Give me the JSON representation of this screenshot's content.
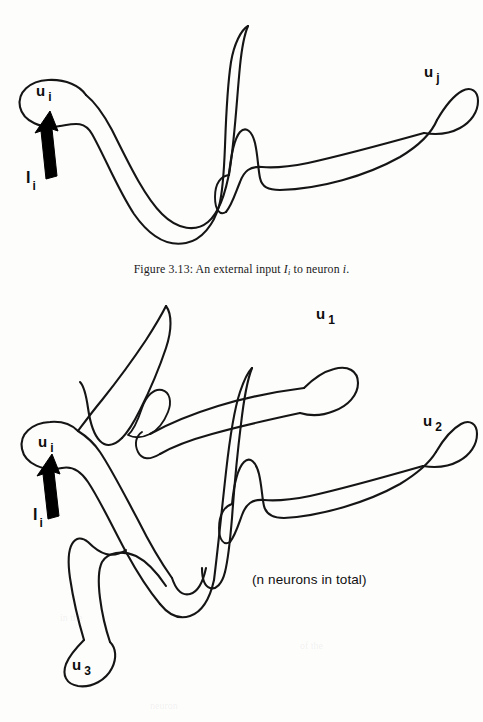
{
  "page": {
    "background_color": "#fdfdfc",
    "ink_color": "#151515",
    "width": 483,
    "height": 722
  },
  "caption": {
    "prefix": "Figure 3.13:",
    "text_before": "An external input",
    "symbol": "I",
    "symbol_subscript": "i",
    "text_after": "to neuron",
    "neuron": "i",
    "period": "."
  },
  "figure_top": {
    "name": "external-input-single-neuron-diagram",
    "labels": [
      {
        "id": "u-i",
        "base": "u",
        "sub": "i",
        "x": 36,
        "y": 90
      },
      {
        "id": "I-i",
        "base": "I",
        "sub": "i",
        "x": 26,
        "y": 175
      },
      {
        "id": "u-j",
        "base": "u",
        "sub": "j",
        "x": 424,
        "y": 71
      }
    ],
    "arrow": {
      "id": "external-input-arrow",
      "from": [
        41,
        174
      ],
      "to": [
        50,
        115
      ]
    }
  },
  "figure_bottom": {
    "name": "n-neuron-network-diagram",
    "labels": [
      {
        "id": "u-i",
        "base": "u",
        "sub": "i",
        "x": 38,
        "y": 441
      },
      {
        "id": "I-i",
        "base": "I",
        "sub": "i",
        "x": 33,
        "y": 514
      },
      {
        "id": "u-1",
        "base": "u",
        "sub": "1",
        "x": 316,
        "y": 313
      },
      {
        "id": "u-2",
        "base": "u",
        "sub": "2",
        "x": 423,
        "y": 420
      },
      {
        "id": "u-3",
        "base": "u",
        "sub": "3",
        "x": 72,
        "y": 683
      }
    ],
    "arrow": {
      "id": "external-input-arrow",
      "from": [
        44,
        514
      ],
      "to": [
        52,
        465
      ]
    },
    "annotation": {
      "id": "n-neurons-note",
      "text": "(n neurons in total)",
      "x": 252,
      "y": 580
    }
  },
  "ghost_marks": [
    {
      "text": "in the",
      "x": 60,
      "y": 612
    },
    {
      "text": "of the",
      "x": 300,
      "y": 640
    },
    {
      "text": "neuron",
      "x": 150,
      "y": 700
    }
  ]
}
